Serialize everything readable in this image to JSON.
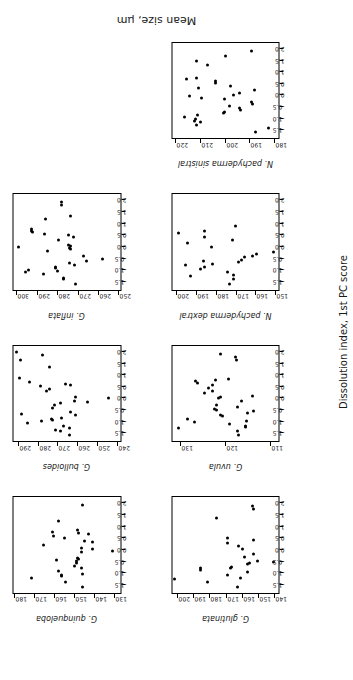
{
  "figure": {
    "xlabel": "Dissolution index, 1st PC score",
    "ylabel": "Mean size, μm"
  },
  "chart_data": [
    {
      "type": "scatter",
      "title": "G. quinqueloba",
      "xlabel": "Dissolution index, 1st PC score",
      "ylabel": "Mean size, μm",
      "xlim": [
        -1.9,
        2.3
      ],
      "ylim": [
        127,
        181
      ],
      "xticks": [
        -1.5,
        -1.0,
        -0.5,
        0.0,
        0.5,
        1.0,
        1.5,
        2.0
      ],
      "yticks": [
        130,
        140,
        150,
        160,
        170,
        180
      ],
      "grid": false,
      "legend": "none",
      "x": [
        -1.62,
        -1.4,
        -1.22,
        -1.15,
        -1.12,
        -1.05,
        -0.92,
        -0.78,
        -0.72,
        -0.6,
        -0.5,
        -0.44,
        -0.4,
        -0.37,
        -0.1,
        -0.05,
        0.02,
        0.1,
        0.22,
        0.33,
        0.4,
        0.52,
        0.62,
        0.7,
        0.74,
        0.8,
        0.86,
        1.28,
        1.95
      ],
      "y": [
        146.0,
        154.5,
        171.8,
        156.6,
        156.9,
        145.8,
        158.0,
        146.3,
        150.0,
        149.0,
        148.9,
        159.4,
        148.0,
        148.6,
        146.5,
        130.8,
        141.0,
        146.6,
        165.6,
        140.9,
        145.0,
        155.2,
        160.8,
        143.2,
        147.8,
        161.0,
        148.4,
        158.0,
        146.2
      ]
    },
    {
      "type": "scatter",
      "title": "G. bulloides",
      "xlabel": "Dissolution index, 1st PC score",
      "ylabel": "Mean size, μm",
      "xlim": [
        -1.9,
        2.3
      ],
      "ylim": [
        238,
        293
      ],
      "xticks": [
        -1.5,
        -1.0,
        -0.5,
        0.0,
        0.5,
        1.0,
        1.5,
        2.0
      ],
      "yticks": [
        240,
        250,
        260,
        270,
        280,
        290
      ],
      "grid": false,
      "legend": "none",
      "x": [
        -1.62,
        -1.45,
        -1.4,
        -1.3,
        -1.22,
        -1.1,
        -1.02,
        -0.96,
        -0.9,
        -0.86,
        -0.74,
        -0.68,
        -0.62,
        -0.42,
        -0.3,
        -0.22,
        -0.18,
        -0.12,
        0.0,
        0.06,
        0.3,
        0.42,
        0.52,
        0.58,
        0.62,
        0.72,
        0.88,
        1.36,
        1.68,
        1.92,
        2.02
      ],
      "y": [
        264.2,
        268.7,
        271.5,
        264.3,
        267.0,
        285.8,
        278.5,
        272.7,
        273.3,
        268.0,
        260.9,
        289.0,
        263.5,
        272.8,
        272.0,
        268.5,
        254.9,
        261.7,
        243.7,
        261.0,
        276.0,
        274.6,
        279.0,
        263.8,
        266.0,
        284.8,
        289.9,
        274.3,
        289.2,
        277.9,
        291.2
      ]
    },
    {
      "type": "scatter",
      "title": "G. inflata",
      "xlabel": "Dissolution index, 1st PC score",
      "ylabel": "Mean size, μm",
      "xlim": [
        -1.9,
        2.3
      ],
      "ylim": [
        249,
        302
      ],
      "xticks": [
        -1.5,
        -1.0,
        -0.5,
        0.0,
        0.5,
        1.0,
        1.5,
        2.0
      ],
      "yticks": [
        250,
        260,
        270,
        280,
        290,
        300
      ],
      "grid": false,
      "legend": "none",
      "x": [
        -1.62,
        -1.42,
        -1.36,
        -1.2,
        -1.12,
        -1.06,
        -1.0,
        -0.95,
        -0.88,
        -0.8,
        -0.72,
        -0.62,
        -0.52,
        -0.4,
        -0.18,
        -0.1,
        -0.05,
        0.0,
        0.05,
        0.1,
        0.3,
        0.42,
        0.5,
        0.58,
        0.66,
        0.7,
        0.78,
        1.22,
        1.36,
        1.82,
        1.98
      ],
      "y": [
        271.2,
        277.2,
        277.3,
        287.1,
        296.0,
        279.9,
        294.7,
        280.9,
        281.0,
        271.7,
        274.3,
        265.7,
        257.7,
        267.2,
        285.1,
        273.7,
        273.9,
        299.3,
        273.4,
        274.5,
        279.8,
        272.3,
        274.4,
        286.5,
        292.4,
        293.1,
        292.8,
        286.0,
        273.5,
        278.1,
        278.2
      ]
    },
    {
      "type": "scatter",
      "title": "G. glutinata",
      "xlabel": "Dissolution index, 1st PC score",
      "ylabel": "Mean size, μm",
      "xlim": [
        -1.9,
        2.3
      ],
      "ylim": [
        137,
        204
      ],
      "xticks": [
        -1.5,
        -1.0,
        -0.5,
        0.0,
        0.5,
        1.0,
        1.5,
        2.0
      ],
      "yticks": [
        140,
        150,
        160,
        170,
        180,
        190,
        200
      ],
      "grid": false,
      "legend": "none",
      "x": [
        -1.62,
        -1.4,
        -1.3,
        -1.22,
        -1.1,
        -0.96,
        -0.9,
        -0.82,
        -0.78,
        -0.74,
        -0.62,
        -0.58,
        -0.52,
        -0.48,
        -0.32,
        -0.2,
        0.02,
        0.18,
        0.32,
        0.42,
        0.5,
        1.42,
        1.78,
        1.92
      ],
      "y": [
        163.0,
        181.8,
        202.2,
        160.7,
        169.0,
        156.3,
        186.0,
        186.3,
        167.0,
        166.5,
        156.8,
        155.5,
        140.0,
        150.3,
        158.2,
        152.6,
        159.9,
        161.9,
        169.2,
        152.8,
        169.3,
        175.9,
        152.5,
        153.3
      ]
    },
    {
      "type": "scatter",
      "title": "G. uvula",
      "xlabel": "Dissolution index, 1st PC score",
      "ylabel": "Mean size, μm",
      "xlim": [
        -1.9,
        2.3
      ],
      "ylim": [
        108,
        132
      ],
      "xticks": [
        -1.5,
        -1.0,
        -0.5,
        0.0,
        0.5,
        1.0,
        1.5,
        2.0
      ],
      "yticks": [
        110,
        120,
        130
      ],
      "grid": false,
      "legend": "none",
      "x": [
        -1.62,
        -1.42,
        -1.32,
        -1.26,
        -1.2,
        -1.12,
        -1.04,
        -0.98,
        -0.9,
        -0.8,
        -0.74,
        -0.66,
        -0.58,
        -0.52,
        -0.46,
        -0.4,
        -0.3,
        -0.1,
        0.0,
        0.04,
        0.1,
        0.22,
        0.32,
        0.46,
        0.58,
        0.66,
        0.74,
        0.8,
        0.86,
        1.68,
        1.82,
        1.96
      ],
      "y": [
        117.0,
        117.2,
        130.6,
        115.5,
        115.4,
        119.0,
        127.0,
        115.3,
        128.6,
        120.6,
        121.0,
        114.9,
        113.6,
        122.0,
        122.4,
        117.2,
        121.9,
        116.3,
        121.6,
        121.0,
        113.9,
        124.6,
        122.9,
        123.8,
        122.8,
        126.3,
        126.6,
        122.2,
        119.2,
        117.5,
        117.8,
        121.0
      ]
    },
    {
      "type": "scatter",
      "title": "N. pachyderma dextral",
      "xlabel": "Dissolution index, 1st PC score",
      "ylabel": "Mean size, μm",
      "xlim": [
        -1.9,
        2.3
      ],
      "ylim": [
        148,
        203
      ],
      "xticks": [
        -1.5,
        -1.0,
        -0.5,
        0.0,
        0.5,
        1.0,
        1.5,
        2.0
      ],
      "yticks": [
        150,
        160,
        170,
        180,
        190,
        200
      ],
      "grid": false,
      "legend": "none",
      "x": [
        -1.62,
        -1.42,
        -1.28,
        -1.22,
        -1.1,
        -0.96,
        -0.9,
        -0.8,
        -0.74,
        -0.68,
        -0.62,
        -0.56,
        -0.46,
        -0.4,
        -0.3,
        -0.22,
        0.0,
        0.18,
        0.32,
        0.42,
        0.62,
        0.7,
        0.92
      ],
      "y": [
        173.5,
        171.3,
        193.3,
        171.1,
        174.2,
        188.4,
        186.2,
        196.0,
        182.0,
        168.8,
        186.5,
        167.3,
        165.5,
        161.6,
        159.3,
        150.5,
        182.5,
        195.0,
        172.0,
        186.0,
        199.8,
        186.4,
        170.0
      ]
    },
    {
      "type": "scatter",
      "title": "N. pachyderma sinistral",
      "xlabel": "Dissolution index, 1st PC score",
      "ylabel": "Mean size, μm",
      "xlim": [
        -1.9,
        2.3
      ],
      "ylim": [
        178,
        222
      ],
      "xticks": [
        -1.5,
        -1.0,
        -0.5,
        0.0,
        0.5,
        1.0,
        1.5,
        2.0
      ],
      "yticks": [
        180,
        190,
        200,
        210,
        220
      ],
      "grid": false,
      "legend": "none",
      "x": [
        -1.62,
        -1.44,
        -1.3,
        -1.18,
        -1.12,
        -1.04,
        -0.96,
        -0.88,
        -0.8,
        -0.74,
        -0.66,
        -0.58,
        -0.46,
        -0.4,
        -0.3,
        -0.18,
        -0.1,
        -0.05,
        0.02,
        0.12,
        0.22,
        0.32,
        0.42,
        0.52,
        0.64,
        0.7,
        0.78,
        1.32,
        1.52,
        1.74,
        1.96
      ],
      "y": [
        187.5,
        182.0,
        211.8,
        210.4,
        212.6,
        212.4,
        216.9,
        211.4,
        200.6,
        200.2,
        193.8,
        194.0,
        198.4,
        188.9,
        189.0,
        200.5,
        210.0,
        214.8,
        196.6,
        194.0,
        188.0,
        211.0,
        198.0,
        204.0,
        204.1,
        216.0,
        211.9,
        207.5,
        211.7,
        199.8,
        189.0
      ]
    }
  ]
}
